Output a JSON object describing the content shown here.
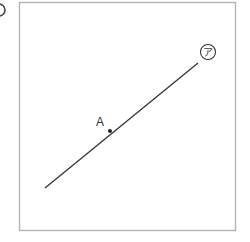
{
  "diagram": {
    "question_marker": "",
    "frame": {
      "x": 19,
      "y": 2,
      "width": 217,
      "height": 229,
      "stroke": "#b3b3b3"
    },
    "line": {
      "x1": 45,
      "y1": 188,
      "x2": 198,
      "y2": 63,
      "stroke": "#333333"
    },
    "point_a": {
      "label": "A",
      "x": 110,
      "y": 131,
      "label_x": 100,
      "label_y": 125
    },
    "line_label": {
      "label": "ア",
      "cx": 208,
      "cy": 52,
      "r": 7.5
    }
  }
}
